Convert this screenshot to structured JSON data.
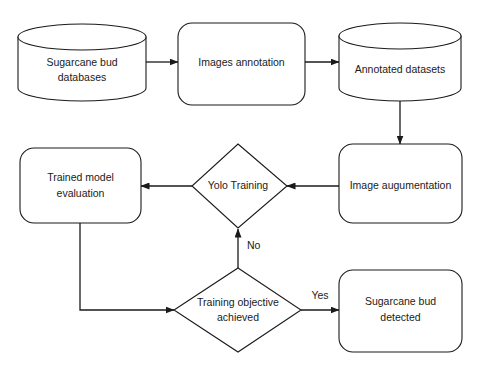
{
  "diagram": {
    "background_color": "#ffffff",
    "stroke_color": "#1a1a1a",
    "fill_color": "#ffffff",
    "nodes": [
      {
        "id": "sugarcane-bud-databases",
        "shape": "cylinder",
        "line1": "Sugarcane bud",
        "line2": "databases"
      },
      {
        "id": "images-annotation",
        "shape": "rounded-rect",
        "line1": "Images annotation",
        "line2": ""
      },
      {
        "id": "annotated-datasets",
        "shape": "cylinder",
        "line1": "Annotated datasets",
        "line2": ""
      },
      {
        "id": "image-augumentation",
        "shape": "rounded-rect",
        "line1": "Image augumentation",
        "line2": ""
      },
      {
        "id": "yolo-training",
        "shape": "diamond",
        "line1": "Yolo Training",
        "line2": ""
      },
      {
        "id": "trained-model-evaluation",
        "shape": "rounded-rect",
        "line1": "Trained model",
        "line2": "evaluation"
      },
      {
        "id": "training-objective-achieved",
        "shape": "diamond",
        "line1": "Training objective",
        "line2": "achieved"
      },
      {
        "id": "sugarcane-bud-detected",
        "shape": "rounded-rect",
        "line1": "Sugarcane bud",
        "line2": "detected"
      }
    ],
    "edge_labels": {
      "no": "No",
      "yes": "Yes"
    },
    "edges": [
      {
        "from": "sugarcane-bud-databases",
        "to": "images-annotation",
        "label": ""
      },
      {
        "from": "images-annotation",
        "to": "annotated-datasets",
        "label": ""
      },
      {
        "from": "annotated-datasets",
        "to": "image-augumentation",
        "label": ""
      },
      {
        "from": "image-augumentation",
        "to": "yolo-training",
        "label": ""
      },
      {
        "from": "yolo-training",
        "to": "trained-model-evaluation",
        "label": ""
      },
      {
        "from": "trained-model-evaluation",
        "to": "training-objective-achieved",
        "label": ""
      },
      {
        "from": "training-objective-achieved",
        "to": "yolo-training",
        "label": "No"
      },
      {
        "from": "training-objective-achieved",
        "to": "sugarcane-bud-detected",
        "label": "Yes"
      }
    ]
  }
}
